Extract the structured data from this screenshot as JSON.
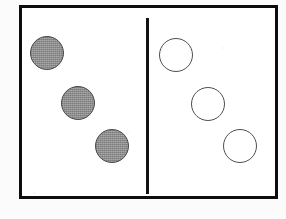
{
  "image": {
    "title": "Two-group sorting diagram",
    "description": "A bordered rectangle split by a vertical line; three shaded circles on the left, three unfilled circles on the right.",
    "width": 286,
    "height": 219,
    "background_color": "#fbfbfb",
    "panel_color": "#ffffff"
  },
  "frame": {
    "name": "outer-rectangle",
    "stroke_color": "#0d0d0d",
    "stroke_width": 3,
    "x": 19,
    "y": 5,
    "width": 259,
    "height": 194
  },
  "divider": {
    "name": "vertical-divider-line",
    "stroke_color": "#121212",
    "stroke_width": 3,
    "x": 146,
    "y_top": 18,
    "y_bottom": 194,
    "length": 176
  },
  "groups": [
    {
      "id": "left-group",
      "label": "shaded circles",
      "fill": "shaded",
      "fill_color": "#8d8d8d",
      "stroke_color": "#4a4a4a",
      "count": 3,
      "circles": [
        {
          "name": "shaded-circle-1",
          "cx": 47,
          "cy": 53,
          "r": 17
        },
        {
          "name": "shaded-circle-2",
          "cx": 78,
          "cy": 103,
          "r": 17
        },
        {
          "name": "shaded-circle-3",
          "cx": 112,
          "cy": 146,
          "r": 17
        }
      ]
    },
    {
      "id": "right-group",
      "label": "unfilled circles",
      "fill": "hollow",
      "fill_color": "#ffffff",
      "stroke_color": "#4f4f4f",
      "count": 3,
      "circles": [
        {
          "name": "hollow-circle-1",
          "cx": 176,
          "cy": 55,
          "r": 17
        },
        {
          "name": "hollow-circle-2",
          "cx": 208,
          "cy": 104,
          "r": 17
        },
        {
          "name": "hollow-circle-3",
          "cx": 240,
          "cy": 146,
          "r": 17
        }
      ]
    }
  ]
}
